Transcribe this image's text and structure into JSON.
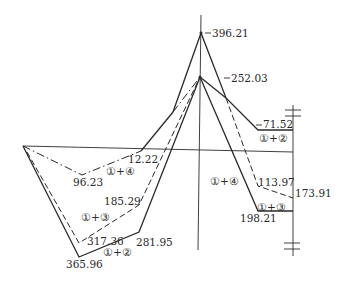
{
  "diagram": {
    "type": "bending-moment-envelope",
    "colors": {
      "ink": "#2a2a2a",
      "background": "#ffffff"
    },
    "value_labels": {
      "peak_top": "396.21",
      "peak_lower": "252.03",
      "right_top": "71.52",
      "right_mid": "113.97",
      "right_end": "173.91",
      "right_bottom": "198.21",
      "left_upper": "12.22",
      "left_dip": "96.23",
      "left_mid": "185.29",
      "left_low_dashed": "317.36",
      "left_low_solid_right": "281.95",
      "left_low_solid": "365.96"
    },
    "combination_labels": {
      "left_1_4": "①+④",
      "left_1_3": "①+③",
      "left_1_2": "①+②",
      "right_1_4": "①+④",
      "right_1_2": "①+②",
      "right_1_3": "①+③"
    },
    "legend_styles": {
      "1+2": "solid",
      "1+3": "dashed",
      "1+4": "dash-dot"
    }
  }
}
